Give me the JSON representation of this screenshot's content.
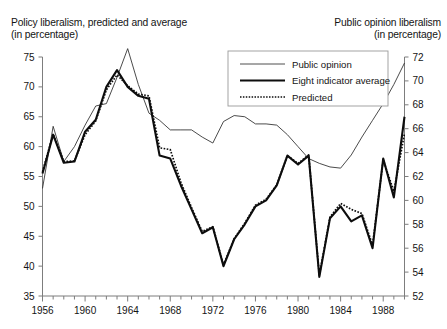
{
  "left_axis_title": "Policy liberalism, predicted and average\n(in percentage)",
  "right_axis_title": "Public opinion liberalism\n(in percentage)",
  "legend": {
    "items": [
      {
        "label": "Public opinion",
        "style": "thin-solid"
      },
      {
        "label": "Eight indicator average",
        "style": "thick-solid"
      },
      {
        "label": "Predicted",
        "style": "dotted"
      }
    ]
  },
  "chart_data": {
    "type": "line",
    "title": "",
    "xlabel": "",
    "ylabel": "Policy liberalism, predicted and average (in percentage)",
    "y2label": "Public opinion liberalism (in percentage)",
    "xlim": [
      1956,
      1990
    ],
    "ylim": [
      35,
      75
    ],
    "y2lim": [
      52,
      72
    ],
    "grid": false,
    "legend_position": "top-center-right",
    "yticks": [
      35,
      40,
      45,
      50,
      55,
      60,
      65,
      70,
      75
    ],
    "y2ticks": [
      52,
      54,
      56,
      58,
      60,
      62,
      64,
      66,
      68,
      70,
      72
    ],
    "xticks": [
      1956,
      1960,
      1964,
      1968,
      1972,
      1976,
      1980,
      1984,
      1988
    ],
    "xtick_minor_step": 1,
    "x": [
      1956,
      1957,
      1958,
      1959,
      1960,
      1961,
      1962,
      1963,
      1964,
      1965,
      1966,
      1967,
      1968,
      1969,
      1970,
      1971,
      1972,
      1973,
      1974,
      1975,
      1976,
      1977,
      1978,
      1979,
      1980,
      1981,
      1982,
      1983,
      1984,
      1985,
      1986,
      1987,
      1988,
      1989,
      1990
    ],
    "series": [
      {
        "name": "Public opinion",
        "axis": "right",
        "values_right_scale": [
          58.0,
          62.2,
          59.8,
          61.2,
          63.0,
          64.6,
          64.8,
          67.0,
          69.4,
          66.4,
          64.0,
          63.4,
          62.6,
          62.6,
          62.6,
          62.0,
          61.5,
          63.3,
          63.8,
          63.7,
          63.1,
          63.1,
          63.0,
          62.2,
          61.2,
          60.2,
          59.8,
          59.5,
          59.4,
          60.5,
          62.0,
          63.4,
          64.8,
          66.4,
          68.2
        ],
        "values_left_scale": [
          53.0,
          63.4,
          57.5,
          60.0,
          63.6,
          66.8,
          67.2,
          71.6,
          76.4,
          70.4,
          65.6,
          64.4,
          62.8,
          62.8,
          62.8,
          61.6,
          60.6,
          64.2,
          65.2,
          65.0,
          63.8,
          63.8,
          63.6,
          62.0,
          60.0,
          58.0,
          57.2,
          56.6,
          56.4,
          58.6,
          61.6,
          64.4,
          67.2,
          70.4,
          74.0
        ]
      },
      {
        "name": "Eight indicator average",
        "axis": "left",
        "values": [
          55.5,
          62.0,
          57.3,
          57.5,
          62.5,
          64.5,
          70.0,
          72.8,
          70.0,
          68.5,
          68.0,
          58.5,
          58.0,
          53.5,
          49.5,
          45.5,
          46.5,
          40.0,
          44.5,
          47.0,
          50.0,
          51.0,
          53.5,
          58.5,
          57.0,
          58.5,
          38.2,
          48.0,
          50.0,
          47.5,
          48.5,
          43.0,
          58.0,
          51.5,
          65.0
        ]
      },
      {
        "name": "Predicted",
        "axis": "left",
        "values": [
          55.8,
          62.1,
          57.5,
          57.6,
          62.0,
          64.3,
          69.5,
          72.0,
          70.2,
          68.8,
          68.5,
          59.8,
          59.5,
          54.0,
          49.8,
          45.8,
          46.6,
          40.2,
          44.6,
          47.2,
          50.2,
          51.2,
          53.6,
          58.5,
          57.2,
          58.6,
          38.5,
          48.2,
          50.5,
          49.5,
          48.8,
          43.5,
          57.8,
          52.5,
          62.2
        ]
      }
    ]
  }
}
